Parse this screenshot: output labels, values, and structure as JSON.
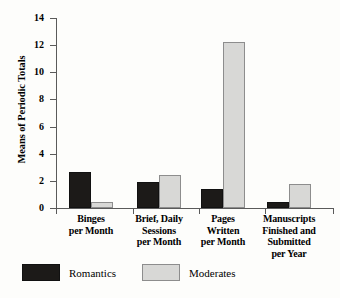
{
  "chart_data": {
    "type": "bar",
    "title": "",
    "subtitle": "",
    "xlabel": "",
    "ylabel": "Means of Periodic Totals",
    "ylim": [
      0,
      14
    ],
    "yticks": [
      0,
      2,
      4,
      6,
      8,
      10,
      12,
      14
    ],
    "grid": false,
    "legend_position": "bottom-left",
    "categories": [
      "Binges\nper Month",
      "Brief, Daily\nSessions\nper Month",
      "Pages\nWritten\nper Month",
      "Manuscripts\nFinished and\nSubmitted\nper Year"
    ],
    "series": [
      {
        "name": "Romantics",
        "color": "#1c1a18",
        "values": [
          2.65,
          1.9,
          1.4,
          0.45
        ]
      },
      {
        "name": "Moderates",
        "color": "#d8d8d6",
        "values": [
          0.45,
          2.45,
          12.25,
          1.75
        ]
      }
    ]
  },
  "axis": {
    "y_label": "Means of Periodic Totals",
    "y_ticks": [
      "0",
      "2",
      "4",
      "6",
      "8",
      "10",
      "12",
      "14"
    ]
  },
  "categories": [
    {
      "lines": [
        "Binges",
        "per Month"
      ]
    },
    {
      "lines": [
        "Brief, Daily",
        "Sessions",
        "per Month"
      ]
    },
    {
      "lines": [
        "Pages",
        "Written",
        "per Month"
      ]
    },
    {
      "lines": [
        "Manuscripts",
        "Finished and",
        "Submitted",
        "per Year"
      ]
    }
  ],
  "legend": {
    "items": [
      {
        "label": "Romantics",
        "color": "#1c1a18"
      },
      {
        "label": "Moderates",
        "color": "#d8d8d6"
      }
    ]
  }
}
